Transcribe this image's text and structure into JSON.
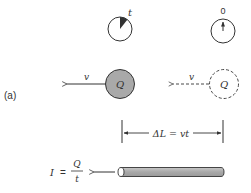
{
  "figure": {
    "panel_label": "(a)",
    "colors": {
      "stroke": "#333333",
      "ball_fill": "#a9a9a9",
      "rod_fill": "#b0b0b0",
      "background": "#ffffff"
    },
    "clock_running": {
      "label": "t",
      "icon": "clock-icon-elapsed"
    },
    "clock_start": {
      "label": "0",
      "icon": "clock-icon-zero"
    },
    "charge_present": {
      "label": "Q",
      "velocity_label": "v"
    },
    "charge_initial": {
      "label": "Q",
      "velocity_label": "v"
    },
    "dimension": {
      "label": "ΔL = vt"
    },
    "current": {
      "lhs": "I",
      "equals": "=",
      "numerator": "Q",
      "denominator": "t"
    }
  }
}
